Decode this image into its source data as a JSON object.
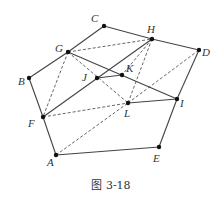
{
  "figure": {
    "caption": "图 3-18",
    "points": {
      "A": {
        "x": 56,
        "y": 155,
        "label": "A",
        "lx": 47,
        "ly": 166
      },
      "B": {
        "x": 29,
        "y": 78,
        "label": "B",
        "lx": 18,
        "ly": 85
      },
      "C": {
        "x": 104,
        "y": 26,
        "label": "C",
        "lx": 91,
        "ly": 22
      },
      "D": {
        "x": 199,
        "y": 50,
        "label": "D",
        "lx": 202,
        "ly": 56
      },
      "E": {
        "x": 159,
        "y": 147,
        "label": "E",
        "lx": 153,
        "ly": 162
      },
      "F": {
        "x": 43,
        "y": 117,
        "label": "F",
        "lx": 28,
        "ly": 127
      },
      "G": {
        "x": 68,
        "y": 52,
        "label": "G",
        "lx": 55,
        "ly": 52
      },
      "H": {
        "x": 152,
        "y": 39,
        "label": "H",
        "lx": 147,
        "ly": 33
      },
      "I": {
        "x": 177,
        "y": 99,
        "label": "I",
        "lx": 180,
        "ly": 107
      },
      "J": {
        "x": 97,
        "y": 78,
        "label": "J",
        "lx": 82,
        "ly": 81
      },
      "K": {
        "x": 122,
        "y": 75,
        "label": "K",
        "lx": 126,
        "ly": 72
      },
      "L": {
        "x": 128,
        "y": 103,
        "label": "L",
        "lx": 124,
        "ly": 117
      }
    },
    "solid_edges": [
      [
        "A",
        "E"
      ],
      [
        "E",
        "I"
      ],
      [
        "I",
        "D"
      ],
      [
        "D",
        "H"
      ],
      [
        "H",
        "C"
      ],
      [
        "C",
        "G"
      ],
      [
        "G",
        "B"
      ],
      [
        "B",
        "F"
      ],
      [
        "F",
        "A"
      ],
      [
        "G",
        "I"
      ],
      [
        "F",
        "H"
      ],
      [
        "J",
        "K"
      ],
      [
        "L",
        "I"
      ]
    ],
    "dashed_edges": [
      [
        "G",
        "H"
      ],
      [
        "G",
        "F"
      ],
      [
        "G",
        "L"
      ],
      [
        "H",
        "L"
      ],
      [
        "H",
        "K"
      ],
      [
        "F",
        "L"
      ],
      [
        "A",
        "L"
      ],
      [
        "L",
        "D"
      ]
    ]
  }
}
